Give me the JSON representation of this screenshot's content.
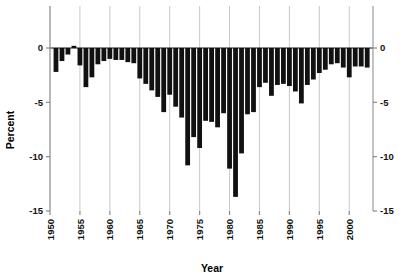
{
  "chart_data": {
    "type": "bar",
    "title": "",
    "xlabel": "Year",
    "ylabel": "Percent",
    "ylim": [
      -15,
      1
    ],
    "xlim": [
      1950.2,
      2003.6
    ],
    "grid": "vertical-only",
    "legend": "none",
    "bar_color": "#111111",
    "y_ticks": [
      0,
      -5,
      -10,
      -15
    ],
    "y_tick_labels": [
      "0",
      "-5",
      "-10",
      "-15"
    ],
    "y_ticks_right": [
      0,
      -5,
      -10,
      -15
    ],
    "y_tick_labels_right": [
      "0",
      "-5",
      "-10",
      "-15"
    ],
    "x_ticks": [
      1950,
      1955,
      1960,
      1965,
      1970,
      1975,
      1980,
      1985,
      1990,
      1995,
      2000
    ],
    "x_tick_labels": [
      "1950",
      "1955",
      "1960",
      "1965",
      "1970",
      "1975",
      "1980",
      "1985",
      "1990",
      "1995",
      "2000"
    ],
    "categories": [
      1951,
      1952,
      1953,
      1954,
      1955,
      1956,
      1957,
      1958,
      1959,
      1960,
      1961,
      1962,
      1963,
      1964,
      1965,
      1966,
      1967,
      1968,
      1969,
      1970,
      1971,
      1972,
      1973,
      1974,
      1975,
      1976,
      1977,
      1978,
      1979,
      1980,
      1981,
      1982,
      1983,
      1984,
      1985,
      1986,
      1987,
      1988,
      1989,
      1990,
      1991,
      1992,
      1993,
      1994,
      1995,
      1996,
      1997,
      1998,
      1999,
      2000,
      2001,
      2002,
      2003
    ],
    "values": [
      -2.2,
      -1.2,
      -0.6,
      0.2,
      -1.6,
      -3.6,
      -2.7,
      -1.5,
      -1.2,
      -1.0,
      -1.1,
      -1.1,
      -1.3,
      -1.4,
      -2.8,
      -3.3,
      -3.9,
      -4.5,
      -5.9,
      -4.3,
      -5.4,
      -6.4,
      -10.8,
      -8.2,
      -9.2,
      -6.7,
      -6.8,
      -7.3,
      -6.0,
      -11.1,
      -13.7,
      -9.7,
      -6.1,
      -5.9,
      -3.6,
      -3.2,
      -4.4,
      -3.4,
      -3.3,
      -3.5,
      -4.0,
      -5.1,
      -3.4,
      -2.9,
      -2.3,
      -2.0,
      -1.5,
      -1.4,
      -1.8,
      -2.7,
      -1.7,
      -1.7,
      -1.8
    ]
  }
}
